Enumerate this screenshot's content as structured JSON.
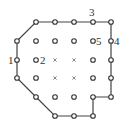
{
  "diagram": {
    "grid": {
      "col_x": [
        17,
        36,
        55,
        74,
        93,
        111
      ],
      "row_y": [
        22,
        41,
        60,
        78,
        97,
        116
      ]
    },
    "nodes": [
      {
        "r": 0,
        "c": 1,
        "type": "circle"
      },
      {
        "r": 0,
        "c": 2,
        "type": "circle"
      },
      {
        "r": 0,
        "c": 3,
        "type": "circle"
      },
      {
        "r": 0,
        "c": 4,
        "type": "circle"
      },
      {
        "r": 0,
        "c": 5,
        "type": "circle"
      },
      {
        "r": 1,
        "c": 0,
        "type": "circle"
      },
      {
        "r": 1,
        "c": 1,
        "type": "circle"
      },
      {
        "r": 1,
        "c": 2,
        "type": "circle"
      },
      {
        "r": 1,
        "c": 3,
        "type": "circle"
      },
      {
        "r": 1,
        "c": 4,
        "type": "circle"
      },
      {
        "r": 1,
        "c": 5,
        "type": "circle"
      },
      {
        "r": 2,
        "c": 0,
        "type": "circle"
      },
      {
        "r": 2,
        "c": 1,
        "type": "circle"
      },
      {
        "r": 2,
        "c": 2,
        "type": "cross"
      },
      {
        "r": 2,
        "c": 3,
        "type": "cross"
      },
      {
        "r": 2,
        "c": 4,
        "type": "circle"
      },
      {
        "r": 2,
        "c": 5,
        "type": "circle"
      },
      {
        "r": 3,
        "c": 0,
        "type": "circle"
      },
      {
        "r": 3,
        "c": 1,
        "type": "circle"
      },
      {
        "r": 3,
        "c": 2,
        "type": "cross"
      },
      {
        "r": 3,
        "c": 3,
        "type": "cross"
      },
      {
        "r": 3,
        "c": 4,
        "type": "circle"
      },
      {
        "r": 3,
        "c": 5,
        "type": "circle"
      },
      {
        "r": 4,
        "c": 1,
        "type": "circle"
      },
      {
        "r": 4,
        "c": 2,
        "type": "circle"
      },
      {
        "r": 4,
        "c": 3,
        "type": "circle"
      },
      {
        "r": 4,
        "c": 4,
        "type": "circle"
      },
      {
        "r": 4,
        "c": 5,
        "type": "circle"
      },
      {
        "r": 5,
        "c": 2,
        "type": "circle"
      },
      {
        "r": 5,
        "c": 3,
        "type": "circle"
      },
      {
        "r": 5,
        "c": 4,
        "type": "circle"
      }
    ],
    "boundary": [
      [
        1,
        0
      ],
      [
        0,
        1
      ],
      [
        0,
        5
      ],
      [
        4,
        5
      ],
      [
        4,
        4
      ],
      [
        5,
        4
      ],
      [
        5,
        2
      ],
      [
        4,
        1
      ],
      [
        3,
        0
      ],
      [
        1,
        0
      ]
    ],
    "labels": [
      {
        "text": "1",
        "x": 8,
        "y": 64
      },
      {
        "text": "2",
        "x": 40,
        "y": 64
      },
      {
        "text": "3",
        "x": 89,
        "y": 16
      },
      {
        "text": "4",
        "x": 114,
        "y": 45
      },
      {
        "text": "5",
        "x": 96,
        "y": 45
      }
    ],
    "colors": {
      "line": "#444444",
      "node": "#333333",
      "background": "#ffffff"
    }
  }
}
